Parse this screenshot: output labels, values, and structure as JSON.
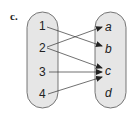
{
  "figure": {
    "label": "c.",
    "domain_set": [
      "1",
      "2",
      "3",
      "4"
    ],
    "codomain_set": [
      "a",
      "b",
      "c",
      "d"
    ],
    "mappings": [
      {
        "from": "1",
        "to": "b"
      },
      {
        "from": "2",
        "to": "a"
      },
      {
        "from": "2",
        "to": "c"
      },
      {
        "from": "3",
        "to": "c"
      },
      {
        "from": "4",
        "to": "c"
      }
    ],
    "colors": {
      "oval_fill": "#e6e6e6",
      "oval_stroke": "#555555",
      "arrow": "#333333",
      "text": "#222222"
    }
  }
}
